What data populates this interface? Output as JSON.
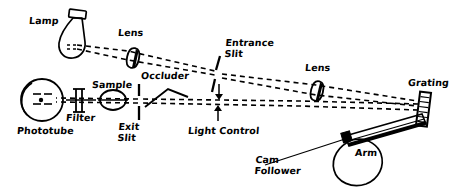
{
  "figure": {
    "kind": "optical-schematic",
    "ink_color": "#000000",
    "background_color": "#ffffff",
    "width": 464,
    "height": 192
  },
  "labels": {
    "lamp": "Lamp",
    "lens_left": "Lens",
    "entrance_slit": "Entrance\nSlit",
    "lens_right": "Lens",
    "grating": "Grating",
    "occluder": "Occluder",
    "sample": "Sample",
    "filter": "Filter",
    "phototube": "Phototube",
    "exit_slit": "Exit\nSlit",
    "light_control": "Light Control",
    "arm": "Arm",
    "cam_follower": "Cam\nFollower"
  },
  "components": [
    {
      "id": "lamp",
      "label": "Lamp",
      "shape": "bulb"
    },
    {
      "id": "lens-left",
      "label": "Lens",
      "shape": "lens-oval"
    },
    {
      "id": "entrance-slit",
      "label": "Entrance Slit",
      "shape": "slit-pair"
    },
    {
      "id": "lens-right",
      "label": "Lens",
      "shape": "lens-oval"
    },
    {
      "id": "grating",
      "label": "Grating",
      "shape": "ruled-bar"
    },
    {
      "id": "occluder",
      "label": "Occluder",
      "shape": "wedge"
    },
    {
      "id": "sample",
      "label": "Sample",
      "shape": "circle"
    },
    {
      "id": "filter",
      "label": "Filter",
      "shape": "plate"
    },
    {
      "id": "phototube",
      "label": "Phototube",
      "shape": "circle-tube"
    },
    {
      "id": "exit-slit",
      "label": "Exit Slit",
      "shape": "slit-pair"
    },
    {
      "id": "light-control",
      "label": "Light Control",
      "shape": "arrow-pair"
    },
    {
      "id": "arm",
      "label": "Arm",
      "shape": "bar"
    },
    {
      "id": "cam-follower",
      "label": "Cam Follower",
      "shape": "teardrop"
    }
  ],
  "beams": {
    "style": "dashed",
    "paths": [
      "lamp-to-entrance-slit-upper",
      "lamp-to-entrance-slit-lower",
      "entrance-slit-to-grating-upper",
      "entrance-slit-to-grating-lower",
      "grating-to-exit-slit-upper",
      "grating-to-exit-slit-lower",
      "exit-slit-through-sample-filter-to-phototube"
    ]
  }
}
